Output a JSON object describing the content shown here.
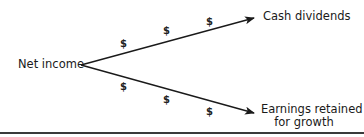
{
  "diagram": {
    "source": {
      "label": "Net income"
    },
    "branches": [
      {
        "label_lines": [
          "Cash dividends"
        ],
        "markers": [
          "$",
          "$",
          "$"
        ]
      },
      {
        "label_lines": [
          "Earnings retained",
          "for growth"
        ],
        "markers": [
          "$",
          "$",
          "$"
        ]
      }
    ],
    "colors": {
      "line": "#1a1a1a",
      "text": "#1a1a1a",
      "rule": "#3a3a3a",
      "background": "#ffffff"
    }
  }
}
